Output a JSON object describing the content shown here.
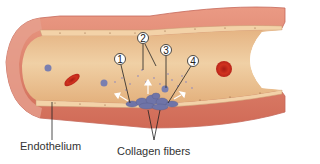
{
  "figure": {
    "labels": {
      "endothelium": "Endothelium",
      "collagen_fibers": "Collagen fibers"
    },
    "callouts": [
      {
        "number": "1",
        "x": 120,
        "y": 59
      },
      {
        "number": "2",
        "x": 143,
        "y": 38
      },
      {
        "number": "3",
        "x": 166,
        "y": 50
      },
      {
        "number": "4",
        "x": 193,
        "y": 61
      }
    ],
    "colors": {
      "vessel_wall_outer": "#e8917c",
      "vessel_wall_mid": "#d9735f",
      "vessel_wall_dark": "#c45a4a",
      "lumen": "#e9c190",
      "lumen_light": "#f2d6ad",
      "endothelium_band": "#f3d2a8",
      "red_blood_cell": "#c8281e",
      "platelet": "#7a7fb0",
      "arrow": "#ffffff",
      "leader_line": "#222222",
      "label_text": "#333333"
    }
  }
}
